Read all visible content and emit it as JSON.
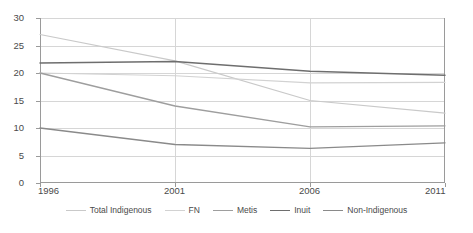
{
  "chart_data": {
    "type": "line",
    "title": "",
    "xlabel": "",
    "ylabel": "",
    "x": [
      "1996",
      "2001",
      "2006",
      "2011"
    ],
    "xtick_labels": [
      "1996",
      "2001",
      "2006",
      "2011"
    ],
    "ytick_labels": [
      "0",
      "5",
      "10",
      "15",
      "20",
      "25",
      "30"
    ],
    "ylim": [
      0,
      30
    ],
    "ytick_step": 5,
    "grid": "horizontal-and-vertical",
    "legend_position": "bottom",
    "series": [
      {
        "name": "Total Indigenous",
        "color": "#c9c9c9",
        "width": 1.2,
        "values": [
          27.0,
          22.2,
          15.0,
          12.7
        ]
      },
      {
        "name": "FN",
        "color": "#d2d2d2",
        "width": 1.2,
        "values": [
          20.0,
          19.5,
          18.2,
          18.3
        ]
      },
      {
        "name": "Metis",
        "color": "#9e9e9e",
        "width": 1.3,
        "values": [
          20.0,
          14.0,
          10.2,
          10.4
        ]
      },
      {
        "name": "Inuit",
        "color": "#6e6e6e",
        "width": 1.5,
        "values": [
          21.8,
          22.1,
          20.3,
          19.6
        ]
      },
      {
        "name": "Non-Indigenous",
        "color": "#8a8a8a",
        "width": 1.4,
        "values": [
          10.0,
          7.0,
          6.3,
          7.3
        ]
      }
    ]
  },
  "colors": {
    "axis": "#9a9a9a",
    "grid": "#d6d6d6",
    "text": "#4a4a4a",
    "background": "#ffffff"
  }
}
